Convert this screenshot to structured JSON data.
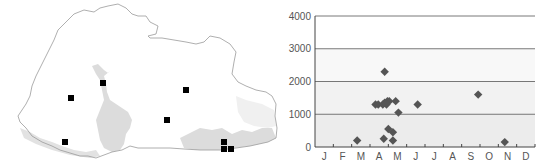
{
  "map": {
    "title": "",
    "marker_color": "#000000",
    "outline_color": "#9a9a9a",
    "shade_color": "#d9d9d9",
    "markers": [
      {
        "x": 71,
        "y": 98
      },
      {
        "x": 103,
        "y": 83
      },
      {
        "x": 186,
        "y": 90
      },
      {
        "x": 167,
        "y": 120
      },
      {
        "x": 65,
        "y": 142
      },
      {
        "x": 224,
        "y": 142
      },
      {
        "x": 224,
        "y": 149
      },
      {
        "x": 231,
        "y": 149
      }
    ]
  },
  "chart_data": {
    "type": "scatter",
    "title": "",
    "xlabel": "",
    "ylabel": "",
    "categories": [
      "J",
      "F",
      "M",
      "A",
      "M",
      "J",
      "J",
      "A",
      "S",
      "O",
      "N",
      "D"
    ],
    "ylim": [
      0,
      4000
    ],
    "yticks": [
      0,
      1000,
      2000,
      3000,
      4000
    ],
    "grid": true,
    "marker": "diamond",
    "marker_color": "#555555",
    "background_bands": [
      {
        "from": 0,
        "to": 1000,
        "color": "#ececec"
      },
      {
        "from": 1000,
        "to": 2000,
        "color": "#f2f2f2"
      },
      {
        "from": 2000,
        "to": 3000,
        "color": "#f8f8f8"
      },
      {
        "from": 3000,
        "to": 4000,
        "color": "#ffffff"
      }
    ],
    "points": [
      {
        "month": 2.8,
        "value": 200
      },
      {
        "month": 3.8,
        "value": 1300
      },
      {
        "month": 3.95,
        "value": 1300
      },
      {
        "month": 4.2,
        "value": 1300
      },
      {
        "month": 4.3,
        "value": 1350
      },
      {
        "month": 4.45,
        "value": 1400
      },
      {
        "month": 4.55,
        "value": 1400
      },
      {
        "month": 4.4,
        "value": 1300
      },
      {
        "month": 4.9,
        "value": 1400
      },
      {
        "month": 4.3,
        "value": 2300
      },
      {
        "month": 5.05,
        "value": 1050
      },
      {
        "month": 6.1,
        "value": 1300
      },
      {
        "month": 4.25,
        "value": 250
      },
      {
        "month": 4.5,
        "value": 550
      },
      {
        "month": 4.75,
        "value": 450
      },
      {
        "month": 4.75,
        "value": 200
      },
      {
        "month": 9.4,
        "value": 1600
      },
      {
        "month": 10.85,
        "value": 150
      }
    ]
  }
}
